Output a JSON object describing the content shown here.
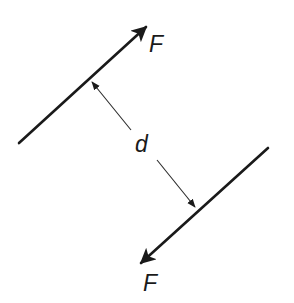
{
  "diagram": {
    "type": "force-couple",
    "colors": {
      "line": "#1a1a1a",
      "dimension": "#2a2a2a",
      "background": "#ffffff"
    },
    "forces": [
      {
        "label": "F",
        "direction": "up-right",
        "line": {
          "x1": 19,
          "y1": 143,
          "x2": 146,
          "y2": 27
        },
        "label_pos": {
          "x": 149,
          "y": 52
        }
      },
      {
        "label": "F",
        "direction": "down-left",
        "line": {
          "x1": 268,
          "y1": 148,
          "x2": 141,
          "y2": 263
        },
        "label_pos": {
          "x": 143,
          "y": 291
        }
      }
    ],
    "distance": {
      "label": "d",
      "label_pos": {
        "x": 135,
        "y": 152
      },
      "upper_arrow": {
        "x1": 131,
        "y1": 130,
        "x2": 92,
        "y2": 82
      },
      "lower_arrow": {
        "x1": 157,
        "y1": 160,
        "x2": 195,
        "y2": 207
      }
    }
  }
}
